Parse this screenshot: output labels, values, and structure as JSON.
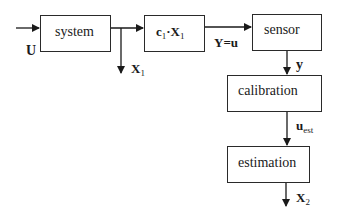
{
  "diagram": {
    "type": "block-diagram",
    "blocks": [
      {
        "id": "system",
        "label": "system"
      },
      {
        "id": "c1x1",
        "label_main": "c",
        "label_sub": "1",
        "label_mid": "·X",
        "label_sub2": "1"
      },
      {
        "id": "sensor",
        "label": "sensor"
      },
      {
        "id": "calibration",
        "label": "calibration"
      },
      {
        "id": "estimation",
        "label": "estimation"
      }
    ],
    "signals": {
      "input": {
        "label": "U"
      },
      "x1": {
        "main": "X",
        "sub": "1"
      },
      "yu": {
        "label": "Y=u"
      },
      "y": {
        "label": "y"
      },
      "uest": {
        "main": "u",
        "sub": "est"
      },
      "x2": {
        "main": "X",
        "sub": "2"
      }
    },
    "edges": [
      {
        "from": "input",
        "to": "system"
      },
      {
        "from": "system",
        "to": "c1x1"
      },
      {
        "from": "system",
        "to": "x1-output"
      },
      {
        "from": "c1x1",
        "to": "sensor",
        "label": "Y=u"
      },
      {
        "from": "sensor",
        "to": "calibration",
        "label": "y"
      },
      {
        "from": "calibration",
        "to": "estimation",
        "label": "u_est"
      },
      {
        "from": "estimation",
        "to": "x2-output",
        "label": "X_2"
      }
    ]
  }
}
